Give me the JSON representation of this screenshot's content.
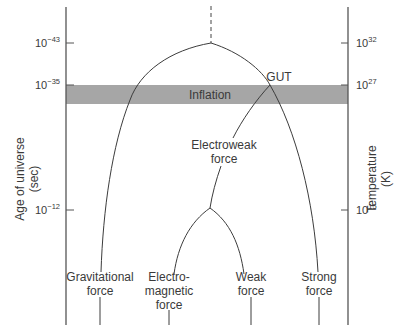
{
  "diagram": {
    "title": "",
    "left_axis": {
      "label_line1": "Age of universe",
      "label_line2": "(sec)",
      "ticks": [
        {
          "base": "10",
          "exp": "−43"
        },
        {
          "base": "10",
          "exp": "−35"
        },
        {
          "base": "10",
          "exp": "−12"
        }
      ]
    },
    "right_axis": {
      "label_line1": "Temperature",
      "label_line2": "(K)",
      "ticks": [
        {
          "base": "10",
          "exp": "32"
        },
        {
          "base": "10",
          "exp": "27"
        },
        {
          "base": "10",
          "exp": "15"
        }
      ]
    },
    "band": {
      "label": "Inflation",
      "color": "#a6a6a6"
    },
    "nodes": {
      "gut": "GUT",
      "electroweak_line1": "Electroweak",
      "electroweak_line2": "force"
    },
    "forces": [
      {
        "line1": "Gravitational",
        "line2": "force",
        "line3": ""
      },
      {
        "line1": "Electro-",
        "line2": "magnetic",
        "line3": "force"
      },
      {
        "line1": "Weak",
        "line2": "force",
        "line3": ""
      },
      {
        "line1": "Strong",
        "line2": "force",
        "line3": ""
      }
    ],
    "colors": {
      "line": "#3c3c3c",
      "axis": "#555555",
      "band": "#a6a6a6",
      "background": "#ffffff"
    }
  }
}
